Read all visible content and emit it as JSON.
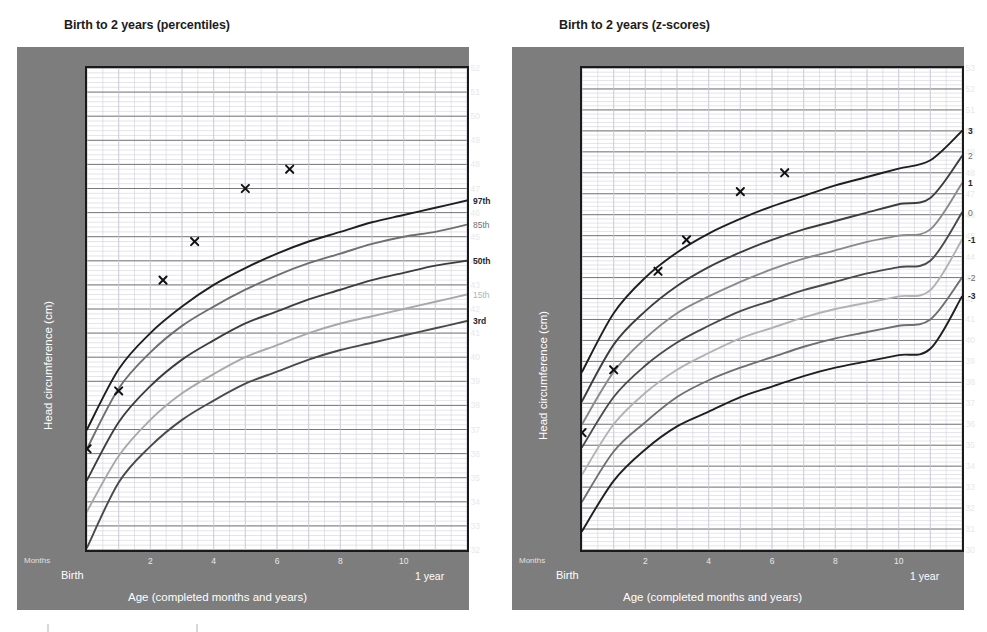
{
  "page": {
    "width": 987,
    "height": 632,
    "background": "#ffffff"
  },
  "palette": {
    "panel_grey": "#7d7d7d",
    "plot_background": "#ffffff",
    "frame": "#1a1a1a",
    "major_grid": "#6b6b6b",
    "minor_grid": "#c9c9d6",
    "curve_outer": "#1f1f1f",
    "curve_mid": "#6f6f6f",
    "curve_inner": "#a8a8a8",
    "marker": "#111111",
    "tick_text": "#e8e8e8",
    "axis_title_text": "#ffffff",
    "title_text": "#1c1c1c"
  },
  "charts": [
    {
      "id": "percentiles",
      "title": "Birth to 2 years (percentiles)",
      "ylabel": "Head circumference (cm)",
      "xlabel": "Age (completed months and years)",
      "months_label": "Months",
      "birth_label": "Birth",
      "year_label": "1 year",
      "yticks": [
        52,
        51,
        50,
        49,
        48,
        47,
        46,
        45,
        44,
        43,
        42,
        41,
        40,
        39,
        38,
        37,
        36,
        35,
        34,
        33,
        32
      ],
      "ylim": [
        32,
        52
      ],
      "xticks": [
        2,
        4,
        6,
        8,
        10
      ],
      "xlim": [
        0,
        12
      ],
      "curve_labels": [
        "97th",
        "85th",
        "50th",
        "15th",
        "3rd"
      ]
    },
    {
      "id": "zscores",
      "title": "Birth to 2 years (z-scores)",
      "ylabel": "Head circumference (cm)",
      "xlabel": "Age (completed months and years)",
      "months_label": "Months",
      "birth_label": "Birth",
      "year_label": "1 year",
      "yticks": [
        53,
        52,
        51,
        50,
        49,
        48,
        47,
        46,
        45,
        44,
        43,
        42,
        41,
        40,
        39,
        38,
        37,
        36,
        35,
        34,
        33,
        32,
        31,
        30
      ],
      "ylim": [
        30,
        53
      ],
      "xticks": [
        2,
        4,
        6,
        8,
        10
      ],
      "xlim": [
        0,
        12
      ],
      "curve_labels": [
        "3",
        "2",
        "1",
        "0",
        "-1",
        "-2",
        "-3"
      ]
    }
  ],
  "chart_data": [
    {
      "type": "line",
      "id": "percentiles",
      "title": "Birth to 2 years (percentiles)",
      "xlabel": "Age (completed months and years)",
      "ylabel": "Head circumference (cm)",
      "xlim": [
        0,
        12
      ],
      "ylim": [
        32,
        52
      ],
      "xticks": [
        2,
        4,
        6,
        8,
        10
      ],
      "xtick_endpoints": [
        "Birth",
        "1 year"
      ],
      "yticks": [
        32,
        33,
        34,
        35,
        36,
        37,
        38,
        39,
        40,
        41,
        42,
        43,
        44,
        45,
        46,
        47,
        48,
        49,
        50,
        51,
        52
      ],
      "grid": true,
      "legend_position": "right-of-plot",
      "x": [
        0,
        1,
        2,
        3,
        4,
        5,
        6,
        7,
        8,
        9,
        10,
        11,
        12
      ],
      "series": [
        {
          "name": "97th",
          "color": "#1f1f1f",
          "values": [
            37.0,
            39.5,
            41.0,
            42.1,
            43.0,
            43.7,
            44.3,
            44.8,
            45.2,
            45.6,
            45.9,
            46.2,
            46.5
          ]
        },
        {
          "name": "85th",
          "color": "#6f6f6f",
          "values": [
            36.2,
            38.7,
            40.2,
            41.3,
            42.1,
            42.8,
            43.4,
            43.9,
            44.3,
            44.7,
            45.0,
            45.2,
            45.5
          ]
        },
        {
          "name": "50th",
          "color": "#3d3d3d",
          "values": [
            34.9,
            37.3,
            38.8,
            39.9,
            40.7,
            41.4,
            41.9,
            42.4,
            42.8,
            43.2,
            43.5,
            43.8,
            44.0
          ]
        },
        {
          "name": "15th",
          "color": "#a8a8a8",
          "values": [
            33.6,
            35.9,
            37.4,
            38.5,
            39.3,
            40.0,
            40.5,
            41.0,
            41.4,
            41.7,
            42.0,
            42.3,
            42.6
          ]
        },
        {
          "name": "3rd",
          "color": "#4a4a4a",
          "values": [
            32.1,
            34.8,
            36.3,
            37.4,
            38.2,
            38.9,
            39.4,
            39.9,
            40.3,
            40.6,
            40.9,
            41.2,
            41.5
          ]
        }
      ],
      "plotted_points": {
        "name": "child measurements",
        "marker": "x",
        "points": [
          {
            "x": 0.0,
            "y": 36.2
          },
          {
            "x": 1.0,
            "y": 38.6
          },
          {
            "x": 2.4,
            "y": 43.2
          },
          {
            "x": 3.4,
            "y": 44.8
          },
          {
            "x": 5.0,
            "y": 47.0
          },
          {
            "x": 6.4,
            "y": 47.8
          }
        ]
      }
    },
    {
      "type": "line",
      "id": "zscores",
      "title": "Birth to 2 years (z-scores)",
      "xlabel": "Age (completed months and years)",
      "ylabel": "Head circumference (cm)",
      "xlim": [
        0,
        12
      ],
      "ylim": [
        30,
        53
      ],
      "xticks": [
        2,
        4,
        6,
        8,
        10
      ],
      "xtick_endpoints": [
        "Birth",
        "1 year"
      ],
      "yticks": [
        30,
        31,
        32,
        33,
        34,
        35,
        36,
        37,
        38,
        39,
        40,
        41,
        42,
        43,
        44,
        45,
        46,
        47,
        48,
        49,
        50,
        51,
        52,
        53
      ],
      "grid": true,
      "legend_position": "right-of-plot",
      "x": [
        0,
        1,
        2,
        3,
        4,
        5,
        6,
        7,
        8,
        9,
        10,
        11,
        12
      ],
      "series": [
        {
          "name": "3",
          "color": "#1f1f1f",
          "values": [
            38.5,
            41.3,
            43.0,
            44.2,
            45.1,
            45.8,
            46.4,
            46.9,
            47.4,
            47.8,
            48.2,
            48.6,
            50.0
          ]
        },
        {
          "name": "2",
          "color": "#3d3d3d",
          "values": [
            37.1,
            39.8,
            41.4,
            42.6,
            43.5,
            44.2,
            44.8,
            45.3,
            45.7,
            46.1,
            46.5,
            46.8,
            48.8
          ]
        },
        {
          "name": "1",
          "color": "#8a8a8a",
          "values": [
            36.0,
            38.5,
            40.1,
            41.3,
            42.1,
            42.8,
            43.4,
            43.9,
            44.3,
            44.7,
            45.0,
            45.3,
            47.5
          ]
        },
        {
          "name": "0",
          "color": "#4a4a4a",
          "values": [
            34.9,
            37.3,
            38.8,
            39.9,
            40.7,
            41.4,
            41.9,
            42.4,
            42.8,
            43.2,
            43.5,
            43.8,
            46.1
          ]
        },
        {
          "name": "-1",
          "color": "#b2b2b2",
          "values": [
            33.6,
            36.0,
            37.5,
            38.6,
            39.4,
            40.1,
            40.6,
            41.1,
            41.5,
            41.8,
            42.1,
            42.4,
            44.8
          ]
        },
        {
          "name": "-2",
          "color": "#6f6f6f",
          "values": [
            32.3,
            34.7,
            36.1,
            37.3,
            38.1,
            38.7,
            39.2,
            39.7,
            40.1,
            40.4,
            40.7,
            41.0,
            43.0
          ]
        },
        {
          "name": "-3",
          "color": "#1f1f1f",
          "values": [
            30.9,
            33.3,
            34.8,
            35.9,
            36.6,
            37.3,
            37.8,
            38.3,
            38.7,
            39.0,
            39.3,
            39.6,
            42.1
          ]
        }
      ],
      "plotted_points": {
        "name": "child measurements",
        "marker": "x",
        "points": [
          {
            "x": 0.0,
            "y": 35.6
          },
          {
            "x": 1.0,
            "y": 38.6
          },
          {
            "x": 2.4,
            "y": 43.3
          },
          {
            "x": 3.3,
            "y": 44.8
          },
          {
            "x": 5.0,
            "y": 47.1
          },
          {
            "x": 6.4,
            "y": 48.0
          }
        ]
      }
    }
  ]
}
